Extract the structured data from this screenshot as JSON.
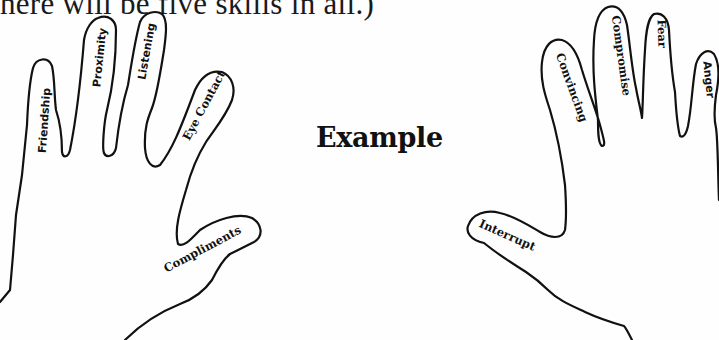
{
  "intro_text": "here will be five skills in all.)",
  "title": "Example",
  "left_hand": {
    "fingers": [
      {
        "label": "Friendship"
      },
      {
        "label": "Proximity"
      },
      {
        "label": "Listening"
      },
      {
        "label": "Eye Contact"
      },
      {
        "label": "Compliments"
      }
    ]
  },
  "right_hand": {
    "fingers": [
      {
        "label": "Convincing"
      },
      {
        "label": "Compromise"
      },
      {
        "label": "Fear"
      },
      {
        "label": "Anger"
      },
      {
        "label": "Interrupt"
      }
    ]
  },
  "colors": {
    "ink": "#111111",
    "paper": "#fefefe"
  }
}
